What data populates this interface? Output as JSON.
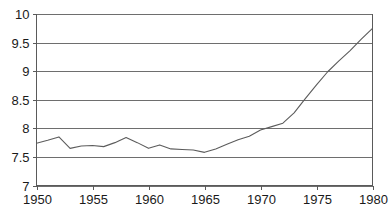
{
  "chart_data": {
    "type": "line",
    "title": "",
    "subtitle": "",
    "xlabel": "",
    "ylabel": "",
    "xlim": [
      1950,
      1980
    ],
    "ylim": [
      7,
      10
    ],
    "grid": true,
    "legend": null,
    "legend_position": "none",
    "x_ticks": [
      1950,
      1955,
      1960,
      1965,
      1970,
      1975,
      1980
    ],
    "x_tick_labels": [
      "1950",
      "1955",
      "1960",
      "1965",
      "1970",
      "1975",
      "1980"
    ],
    "y_ticks": [
      7,
      7.5,
      8,
      8.5,
      9,
      9.5,
      10
    ],
    "y_tick_labels": [
      "7",
      "7.5",
      "8",
      "8.5",
      "9",
      "9.5",
      "10"
    ],
    "line_color": "#5c5c5c",
    "grid_color": "#6e6e6e",
    "axis_color": "#5a5a5a",
    "background_color": "#ffffff",
    "series": [
      {
        "name": "series-1",
        "x": [
          1950,
          1951,
          1952,
          1953,
          1954,
          1955,
          1956,
          1957,
          1958,
          1959,
          1960,
          1961,
          1962,
          1963,
          1964,
          1965,
          1966,
          1967,
          1968,
          1969,
          1970,
          1971,
          1972,
          1973,
          1974,
          1975,
          1976,
          1977,
          1978,
          1979,
          1980
        ],
        "values": [
          7.74,
          7.79,
          7.85,
          7.65,
          7.69,
          7.7,
          7.68,
          7.75,
          7.84,
          7.75,
          7.65,
          7.71,
          7.64,
          7.63,
          7.62,
          7.58,
          7.64,
          7.72,
          7.8,
          7.86,
          7.97,
          8.03,
          8.09,
          8.27,
          8.52,
          8.76,
          8.99,
          9.18,
          9.36,
          9.56,
          9.75
        ]
      }
    ]
  },
  "axes": {
    "y_axis_name": "value-axis",
    "x_axis_name": "year-axis"
  }
}
